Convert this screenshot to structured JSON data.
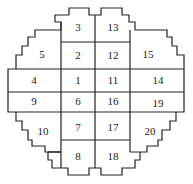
{
  "diagram": {
    "type": "core-layout-grid",
    "cells": [
      {
        "id": "1",
        "x": 78,
        "y": 81
      },
      {
        "id": "2",
        "x": 78,
        "y": 56
      },
      {
        "id": "3",
        "x": 78,
        "y": 28
      },
      {
        "id": "4",
        "x": 34,
        "y": 81
      },
      {
        "id": "5",
        "x": 42,
        "y": 55
      },
      {
        "id": "6",
        "x": 78,
        "y": 102
      },
      {
        "id": "7",
        "x": 78,
        "y": 128
      },
      {
        "id": "8",
        "x": 78,
        "y": 157
      },
      {
        "id": "9",
        "x": 34,
        "y": 102
      },
      {
        "id": "10",
        "x": 43,
        "y": 132
      },
      {
        "id": "11",
        "x": 113,
        "y": 81
      },
      {
        "id": "12",
        "x": 113,
        "y": 56
      },
      {
        "id": "13",
        "x": 113,
        "y": 28
      },
      {
        "id": "14",
        "x": 158,
        "y": 81
      },
      {
        "id": "15",
        "x": 148,
        "y": 55
      },
      {
        "id": "16",
        "x": 113,
        "y": 102
      },
      {
        "id": "17",
        "x": 113,
        "y": 128
      },
      {
        "id": "18",
        "x": 113,
        "y": 157
      },
      {
        "id": "19",
        "x": 158,
        "y": 104
      },
      {
        "id": "20",
        "x": 150,
        "y": 132
      }
    ]
  }
}
